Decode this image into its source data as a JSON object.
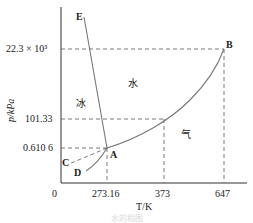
{
  "diagram": {
    "title": "水的相图",
    "axes": {
      "x_label": "T/K",
      "y_label": "p/kPa",
      "origin": "0",
      "x_ticks": [
        "273.16",
        "373",
        "647"
      ],
      "y_ticks": [
        "0.610 6",
        "101.33",
        "22.3 × 10³"
      ]
    },
    "points": {
      "A": "A",
      "B": "B",
      "C": "C",
      "D": "D",
      "E": "E"
    },
    "regions": {
      "ice": "冰",
      "water": "水",
      "vapor": "气"
    },
    "colors": {
      "line": "#777777",
      "axis": "#333333",
      "text": "#222222"
    }
  }
}
